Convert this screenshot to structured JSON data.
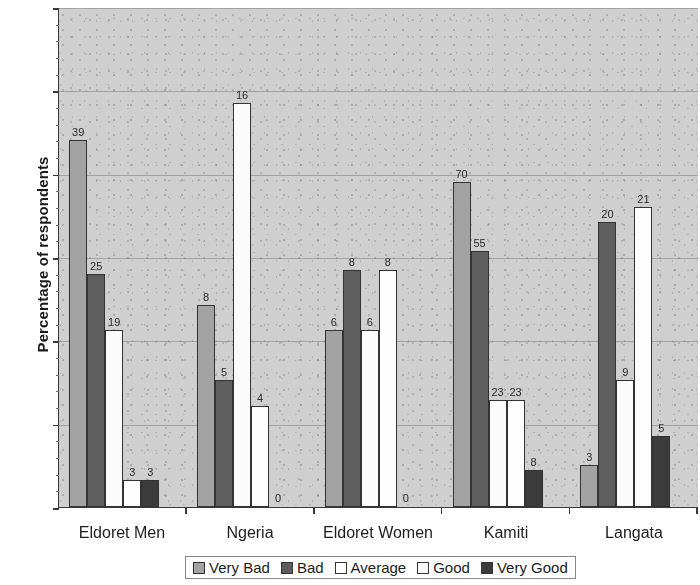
{
  "chart_data": {
    "type": "bar",
    "title": "",
    "xlabel": "",
    "ylabel": "Percentage of respondents",
    "ylim": [
      0,
      60
    ],
    "yticks": [
      0,
      10,
      20,
      30,
      40,
      50,
      60
    ],
    "grid": true,
    "legend_position": "bottom",
    "categories": [
      "Eldoret Men",
      "Ngeria",
      "Eldoret Women",
      "Kamiti",
      "Langata"
    ],
    "series": [
      {
        "name": "Very Bad",
        "color": "#a3a3a3",
        "values": [
          44.0,
          24.2,
          21.3,
          39.0,
          5.0
        ],
        "labels": [
          "39",
          "8",
          "6",
          "70",
          "3"
        ]
      },
      {
        "name": "Bad",
        "color": "#5e5e5e",
        "values": [
          28.0,
          15.2,
          28.5,
          30.7,
          34.2
        ],
        "labels": [
          "25",
          "5",
          "8",
          "55",
          "20"
        ]
      },
      {
        "name": "Average",
        "color": "#fbfbfb",
        "values": [
          21.3,
          48.5,
          21.3,
          12.8,
          15.3
        ],
        "labels": [
          "19",
          "16",
          "6",
          "23",
          "9"
        ]
      },
      {
        "name": "Good",
        "color": "#fdfdfd",
        "values": [
          3.3,
          12.1,
          28.5,
          12.8,
          36.0
        ],
        "labels": [
          "3",
          "4",
          "8",
          "23",
          "21"
        ]
      },
      {
        "name": "Very Good",
        "color": "#3b3b3b",
        "values": [
          3.3,
          0,
          0,
          4.4,
          8.5
        ],
        "labels": [
          "3",
          "0",
          "0",
          "8",
          "5"
        ]
      }
    ]
  },
  "legend": {
    "items": [
      {
        "label": "Very Bad",
        "swatch": "#a3a3a3"
      },
      {
        "label": "Bad",
        "swatch": "#5e5e5e"
      },
      {
        "label": "Average",
        "swatch": "#fbfbfb"
      },
      {
        "label": "Good",
        "swatch": "#fdfdfd"
      },
      {
        "label": "Very Good",
        "swatch": "#3b3b3b"
      }
    ]
  }
}
